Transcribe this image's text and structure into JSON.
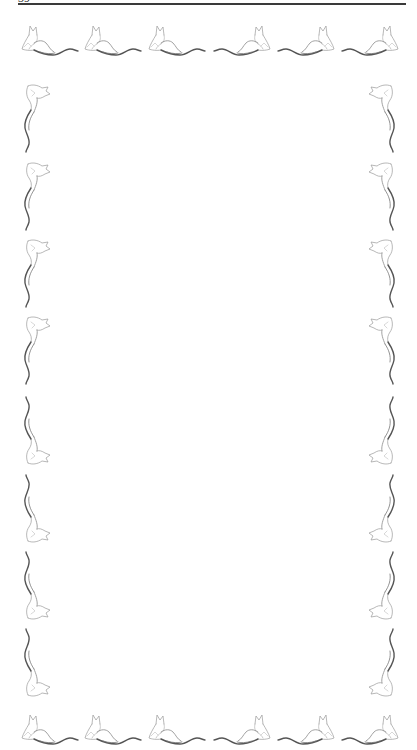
{
  "page": {
    "header": {
      "page_number_clipped": "39",
      "has_rule": true
    },
    "border": {
      "motif": "reclining-cat-icon",
      "stroke_color": "#8a8a8a",
      "tail_color": "#555555",
      "top_row": [
        {
          "x": 20,
          "y": 23,
          "facing": "left"
        },
        {
          "x": 83,
          "y": 23,
          "facing": "left"
        },
        {
          "x": 147,
          "y": 23,
          "facing": "left"
        },
        {
          "x": 212,
          "y": 23,
          "facing": "right"
        },
        {
          "x": 276,
          "y": 23,
          "facing": "right"
        },
        {
          "x": 340,
          "y": 23,
          "facing": "right"
        }
      ],
      "bottom_row": [
        {
          "x": 20,
          "y": 712,
          "facing": "left"
        },
        {
          "x": 83,
          "y": 712,
          "facing": "left"
        },
        {
          "x": 147,
          "y": 712,
          "facing": "left"
        },
        {
          "x": 212,
          "y": 712,
          "facing": "right"
        },
        {
          "x": 276,
          "y": 712,
          "facing": "right"
        },
        {
          "x": 340,
          "y": 712,
          "facing": "right"
        }
      ],
      "left_column": [
        {
          "x": 18,
          "y": 82,
          "head": "top"
        },
        {
          "x": 18,
          "y": 160,
          "head": "top"
        },
        {
          "x": 18,
          "y": 237,
          "head": "top"
        },
        {
          "x": 18,
          "y": 314,
          "head": "top"
        },
        {
          "x": 18,
          "y": 395,
          "head": "bottom"
        },
        {
          "x": 18,
          "y": 473,
          "head": "bottom"
        },
        {
          "x": 18,
          "y": 550,
          "head": "bottom"
        },
        {
          "x": 18,
          "y": 627,
          "head": "bottom"
        }
      ],
      "right_column": [
        {
          "x": 365,
          "y": 82,
          "head": "top"
        },
        {
          "x": 365,
          "y": 160,
          "head": "top"
        },
        {
          "x": 365,
          "y": 237,
          "head": "top"
        },
        {
          "x": 365,
          "y": 314,
          "head": "top"
        },
        {
          "x": 365,
          "y": 395,
          "head": "bottom"
        },
        {
          "x": 365,
          "y": 473,
          "head": "bottom"
        },
        {
          "x": 365,
          "y": 550,
          "head": "bottom"
        },
        {
          "x": 365,
          "y": 627,
          "head": "bottom"
        }
      ]
    },
    "body_text": ""
  }
}
